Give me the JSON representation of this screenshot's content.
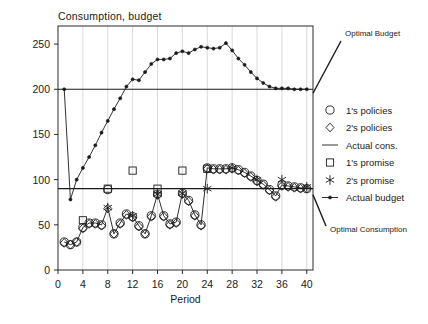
{
  "chart_data": {
    "type": "line",
    "title": "Consumption, budget",
    "xlabel": "Period",
    "ylabel": "",
    "xlim": [
      0,
      41
    ],
    "ylim": [
      0,
      270
    ],
    "xticks": [
      0,
      4,
      8,
      12,
      16,
      20,
      24,
      28,
      32,
      36,
      40
    ],
    "yticks": [
      0,
      50,
      100,
      150,
      200,
      250
    ],
    "grid": "vertical",
    "legend_position": "right",
    "annotations": [
      {
        "text": "Optimal Budget",
        "value": 200
      },
      {
        "text": "Optimal Consumption",
        "value": 90
      }
    ],
    "reference_lines": [
      {
        "name": "Optimal Budget",
        "y": 200
      },
      {
        "name": "Optimal Consumption",
        "y": 90
      }
    ],
    "series": [
      {
        "name": "Actual budget",
        "marker": "filled-dot",
        "x": [
          1,
          2,
          3,
          4,
          5,
          6,
          7,
          8,
          9,
          10,
          11,
          12,
          13,
          14,
          15,
          16,
          17,
          18,
          19,
          20,
          21,
          22,
          23,
          24,
          25,
          26,
          27,
          28,
          29,
          30,
          31,
          32,
          33,
          34,
          35,
          36,
          37,
          38,
          39,
          40
        ],
        "values": [
          200,
          78,
          100,
          113,
          125,
          138,
          152,
          165,
          178,
          190,
          203,
          211,
          210,
          219,
          228,
          233,
          233,
          234,
          240,
          242,
          240,
          244,
          247,
          246,
          245,
          246,
          251,
          243,
          234,
          227,
          219,
          212,
          207,
          203,
          201,
          201,
          201,
          200,
          200,
          200
        ]
      },
      {
        "name": "Actual cons.",
        "marker": "line",
        "x": [
          1,
          2,
          3,
          4,
          5,
          6,
          7,
          8,
          9,
          10,
          11,
          12,
          13,
          14,
          15,
          16,
          17,
          18,
          19,
          20,
          21,
          22,
          23,
          24,
          25,
          26,
          27,
          28,
          29,
          30,
          31,
          32,
          33,
          34,
          35,
          36,
          37,
          38,
          39,
          40
        ],
        "values": [
          31,
          28,
          31,
          47,
          52,
          52,
          50,
          69,
          40,
          52,
          62,
          59,
          49,
          40,
          60,
          84,
          60,
          51,
          53,
          85,
          77,
          61,
          50,
          113,
          112,
          112,
          112,
          113,
          111,
          108,
          104,
          99,
          95,
          89,
          82,
          94,
          93,
          92,
          91,
          90
        ]
      },
      {
        "name": "1's policies",
        "marker": "circle",
        "x": [
          1,
          2,
          3,
          4,
          5,
          6,
          7,
          8,
          9,
          10,
          11,
          12,
          13,
          14,
          15,
          16,
          17,
          18,
          19,
          20,
          21,
          22,
          23,
          24,
          25,
          26,
          27,
          28,
          29,
          30,
          31,
          32,
          33,
          34,
          35,
          36,
          37,
          38,
          39,
          40
        ],
        "values": [
          31,
          28,
          31,
          47,
          52,
          52,
          50,
          89,
          40,
          52,
          62,
          59,
          49,
          40,
          60,
          84,
          60,
          51,
          53,
          85,
          77,
          61,
          50,
          113,
          112,
          112,
          112,
          113,
          111,
          108,
          104,
          99,
          95,
          89,
          82,
          94,
          93,
          92,
          91,
          90
        ]
      },
      {
        "name": "2's policies",
        "marker": "diamond",
        "x": [
          1,
          2,
          3,
          4,
          5,
          6,
          7,
          8,
          9,
          10,
          11,
          12,
          13,
          14,
          15,
          16,
          17,
          18,
          19,
          20,
          21,
          22,
          23,
          24,
          25,
          26,
          27,
          28,
          29,
          30,
          31,
          32,
          33,
          34,
          35,
          36,
          37,
          38,
          39,
          40
        ],
        "values": [
          30,
          28,
          31,
          46,
          51,
          51,
          49,
          68,
          40,
          51,
          61,
          58,
          48,
          40,
          59,
          83,
          59,
          50,
          52,
          84,
          76,
          60,
          49,
          112,
          111,
          111,
          111,
          112,
          110,
          107,
          103,
          98,
          94,
          88,
          81,
          93,
          92,
          91,
          90,
          90
        ]
      },
      {
        "name": "1's promise",
        "marker": "square",
        "x": [
          4,
          8,
          12,
          16,
          20,
          24
        ],
        "values": [
          55,
          90,
          110,
          90,
          110,
          112
        ]
      },
      {
        "name": "2's promise",
        "marker": "asterisk",
        "x": [
          8,
          12,
          16,
          20,
          24,
          28,
          32,
          36,
          40
        ],
        "values": [
          69,
          60,
          84,
          85,
          90,
          113,
          100,
          100,
          92
        ]
      }
    ]
  },
  "legend": {
    "items": [
      {
        "label": "1's policies",
        "glyph": "circle"
      },
      {
        "label": "2's policies",
        "glyph": "diamond"
      },
      {
        "label": "Actual cons.",
        "glyph": "line"
      },
      {
        "label": "1's promise",
        "glyph": "square"
      },
      {
        "label": "2's promise",
        "glyph": "asterisk"
      },
      {
        "label": "Actual budget",
        "glyph": "dot-line"
      }
    ]
  },
  "colors": {
    "ink": "#1a1a1a",
    "grid": "#c9c9c9",
    "background": "#ffffff"
  }
}
